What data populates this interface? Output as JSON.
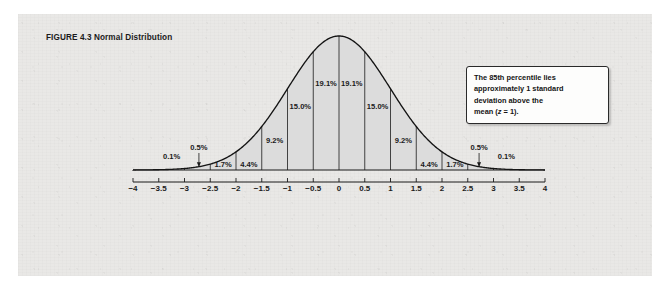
{
  "figure": {
    "caption_label": "FIGURE 4.3",
    "caption_title": "Normal Distribution"
  },
  "callout": {
    "line1": "The 85th percentile lies",
    "line2": "approximately 1 standard",
    "line3": "deviation above the",
    "line4_pre": "mean (",
    "line4_var": "z",
    "line4_post": " = 1)."
  },
  "axes": {
    "zscore_title": "z-Score",
    "sd_title": "Standard Deviation",
    "cumulative_title": "Cumulative Percent"
  },
  "chart_data": {
    "type": "area",
    "title": "Normal Distribution",
    "xlabel": "z-Score",
    "ylabel": "",
    "xlim": [
      -4,
      4
    ],
    "grid": false,
    "legend": "none",
    "curve": "standard normal density",
    "band_boundaries": [
      -4,
      -3.5,
      -3,
      -2.5,
      -2,
      -1.5,
      -1,
      -0.5,
      0,
      0.5,
      1,
      1.5,
      2,
      2.5,
      3,
      3.5,
      4
    ],
    "band_labels": [
      "0.1%",
      "0.5%",
      "1.7%",
      "4.4%",
      "9.2%",
      "15.0%",
      "19.1%",
      "19.1%",
      "15.0%",
      "9.2%",
      "4.4%",
      "1.7%",
      "0.5%",
      "0.1%"
    ],
    "band_label_positions": [
      -3.25,
      -2.72,
      -2.25,
      -1.75,
      -1.25,
      -0.75,
      -0.25,
      0.25,
      0.75,
      1.25,
      1.75,
      2.25,
      2.72,
      3.25
    ],
    "zscore_ticks": [
      -4,
      -3.5,
      -3,
      -2.5,
      -2,
      -1.5,
      -1,
      -0.5,
      0,
      0.5,
      1,
      1.5,
      2,
      2.5,
      3,
      3.5,
      4
    ],
    "zscore_tick_labels": [
      "−4",
      "−3.5",
      "−3",
      "−2.5",
      "−2",
      "−1.5",
      "−1",
      "−0.5",
      "0",
      "0.5",
      "1",
      "1.5",
      "2",
      "2.5",
      "3",
      "3.5",
      "4"
    ],
    "sd_ticks": [
      -4,
      -3,
      -2,
      -1,
      0,
      1,
      2,
      3,
      4
    ],
    "sd_tick_labels": [
      "−4σ",
      "−3σ",
      "−2σ",
      "−1σ",
      "0",
      "+1σ",
      "+2σ",
      "+3σ",
      "+4σ"
    ],
    "cumulative_at_sd": [
      -3,
      -2,
      -1,
      0,
      1,
      2,
      3
    ],
    "cumulative_at_sd_labels": [
      "0.1%",
      "2.3%",
      "15.9%",
      "50%",
      "84.1%",
      "97.7%",
      "99.9%"
    ],
    "percentile_scale_values": [
      1,
      5,
      10,
      20,
      30,
      40,
      50,
      60,
      70,
      80,
      90,
      95,
      99
    ],
    "percentile_scale_labels": [
      "1%",
      "5%",
      "10%",
      "20",
      "30",
      "40",
      "50",
      "60",
      "70",
      "80",
      "90%",
      "95%",
      "99%"
    ],
    "percentile_scale_z": [
      -2.326,
      -1.645,
      -1.282,
      -0.842,
      -0.524,
      -0.253,
      0,
      0.253,
      0.524,
      0.842,
      1.282,
      1.645,
      2.326
    ],
    "callout_annotation": "The 85th percentile lies approximately 1 standard deviation above the mean (z = 1).",
    "callout_target_z": 1
  },
  "colors": {
    "paper": "#e9e8e6",
    "ink": "#1b1b1b",
    "shade": "#dcdcdc",
    "curve": "#141414"
  }
}
